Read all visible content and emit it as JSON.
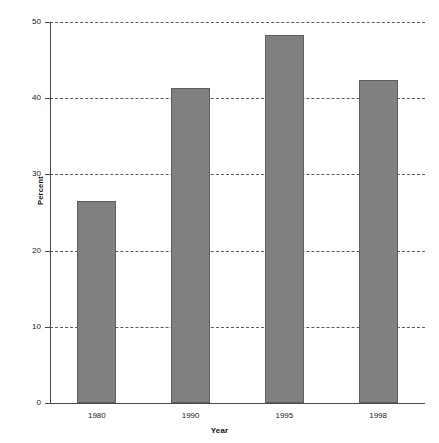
{
  "chart_data": {
    "type": "bar",
    "title": "",
    "xlabel": "Year",
    "ylabel": "Percent",
    "categories": [
      "1980",
      "1990",
      "1995",
      "1998"
    ],
    "values": [
      26.5,
      41.4,
      48.3,
      42.4
    ],
    "ylim": [
      0,
      50
    ],
    "yticks": [
      0,
      10,
      20,
      30,
      40,
      50
    ],
    "ytick_labels": [
      "0",
      "10",
      "20",
      "30",
      "40",
      "50"
    ],
    "grid": true,
    "grid_style": "dashed",
    "legend": "none",
    "bar_color": "#808080",
    "bar_border_color": "#5e5e5e",
    "background_color": "#ffffff",
    "axis_color": "#4a4a4a"
  }
}
